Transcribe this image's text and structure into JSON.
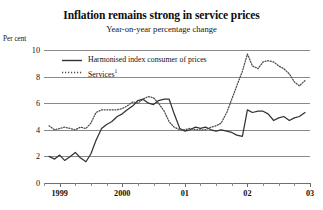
{
  "title": "Inflation remains strong in service prices",
  "subtitle": "Year-on-year percentage change",
  "axis_unit": "Per cent",
  "legend": [
    {
      "label": "Harmonised index consumer of prices",
      "style": "solid",
      "color": "#333333"
    },
    {
      "label": "Services",
      "footnote": "1",
      "style": "dotted",
      "color": "#4a4a4a"
    }
  ],
  "chart_data": {
    "type": "line",
    "title": "Inflation remains strong in service prices",
    "subtitle": "Year-on-year percentage change",
    "xlabel": "",
    "ylabel": "Per cent",
    "ylim": [
      0,
      10
    ],
    "yticks": [
      0,
      2,
      4,
      6,
      8,
      10
    ],
    "xlim": [
      1998.75,
      2003.0
    ],
    "xtick_labels": [
      "1999",
      "2000",
      "01",
      "02",
      "03"
    ],
    "xtick_values": [
      1999,
      2000,
      2001,
      2002,
      2003
    ],
    "minor_tick_interval": 0.25,
    "grid": "horizontal",
    "legend_position": "top-left-inside",
    "series": [
      {
        "name": "Harmonised index consumer of prices",
        "style": "solid",
        "color": "#333333",
        "x": [
          1998.83,
          1998.92,
          1999.0,
          1999.08,
          1999.17,
          1999.25,
          1999.33,
          1999.42,
          1999.5,
          1999.58,
          1999.67,
          1999.75,
          1999.83,
          1999.92,
          2000.0,
          2000.08,
          2000.17,
          2000.25,
          2000.33,
          2000.42,
          2000.5,
          2000.58,
          2000.67,
          2000.75,
          2000.83,
          2000.92,
          2001.0,
          2001.08,
          2001.17,
          2001.25,
          2001.33,
          2001.42,
          2001.5,
          2001.58,
          2001.67,
          2001.75,
          2001.83,
          2001.92,
          2002.0,
          2002.08,
          2002.17,
          2002.25,
          2002.33,
          2002.42,
          2002.5,
          2002.58,
          2002.67,
          2002.75,
          2002.83,
          2002.92
        ],
        "y": [
          2.0,
          1.8,
          2.1,
          1.7,
          2.0,
          2.3,
          1.9,
          1.6,
          2.2,
          3.2,
          4.1,
          4.4,
          4.6,
          5.0,
          5.2,
          5.5,
          5.8,
          6.2,
          6.3,
          6.0,
          5.9,
          6.2,
          6.3,
          6.3,
          5.2,
          4.1,
          3.9,
          4.0,
          4.2,
          4.1,
          4.2,
          4.0,
          3.9,
          4.0,
          3.9,
          3.8,
          3.6,
          3.5,
          5.5,
          5.3,
          5.4,
          5.4,
          5.2,
          4.7,
          4.9,
          5.0,
          4.7,
          4.9,
          5.0,
          5.3
        ]
      },
      {
        "name": "Services",
        "style": "dotted",
        "color": "#4a4a4a",
        "x": [
          1998.83,
          1998.92,
          1999.0,
          1999.08,
          1999.17,
          1999.25,
          1999.33,
          1999.42,
          1999.5,
          1999.58,
          1999.67,
          1999.75,
          1999.83,
          1999.92,
          2000.0,
          2000.08,
          2000.17,
          2000.25,
          2000.33,
          2000.42,
          2000.5,
          2000.58,
          2000.67,
          2000.75,
          2000.83,
          2000.92,
          2001.0,
          2001.08,
          2001.17,
          2001.25,
          2001.33,
          2001.42,
          2001.5,
          2001.58,
          2001.67,
          2001.75,
          2001.83,
          2001.92,
          2002.0,
          2002.08,
          2002.17,
          2002.25,
          2002.33,
          2002.42,
          2002.5,
          2002.58,
          2002.67,
          2002.75,
          2002.83,
          2002.92
        ],
        "y": [
          4.3,
          4.0,
          4.1,
          4.2,
          4.1,
          4.0,
          4.2,
          4.1,
          4.5,
          5.3,
          5.5,
          5.5,
          5.5,
          5.5,
          5.6,
          5.8,
          6.1,
          6.0,
          6.3,
          6.5,
          6.4,
          6.0,
          5.4,
          4.6,
          4.2,
          4.0,
          4.0,
          4.1,
          4.0,
          4.0,
          4.0,
          4.2,
          4.3,
          4.5,
          5.3,
          6.3,
          7.3,
          8.4,
          9.7,
          8.8,
          8.6,
          9.1,
          9.2,
          9.1,
          8.8,
          8.6,
          8.2,
          7.6,
          7.3,
          7.7
        ]
      }
    ]
  }
}
